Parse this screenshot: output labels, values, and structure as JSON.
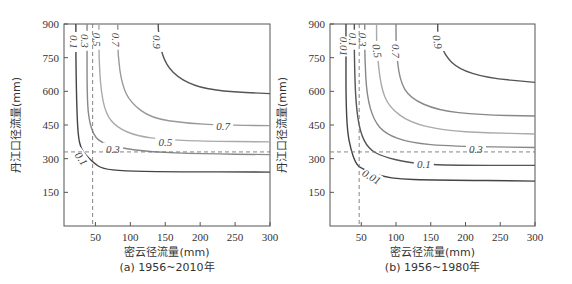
{
  "chart_data": [
    {
      "type": "contour",
      "panel": "a",
      "caption": "(a) 1956~2010年",
      "xlabel": "密云径流量(mm)",
      "ylabel": "丹江口径流量(mm)",
      "xticks": [
        50,
        100,
        150,
        200,
        250,
        300
      ],
      "yticks": [
        150,
        300,
        450,
        600,
        750,
        900
      ],
      "xlim": [
        5,
        300
      ],
      "ylim": [
        0,
        900
      ],
      "reference_lines": {
        "x": 46,
        "y": 330,
        "style": "dashed"
      },
      "contours": [
        {
          "level": "0.1",
          "color": "#444444",
          "points": [
            [
              22,
              900
            ],
            [
              22,
              760
            ],
            [
              23,
              560
            ],
            [
              25,
              400
            ],
            [
              30,
              340
            ],
            [
              38,
              310
            ],
            [
              48,
              280
            ],
            [
              60,
              255
            ],
            [
              90,
              245
            ],
            [
              150,
              242
            ],
            [
              300,
              240
            ]
          ],
          "label": {
            "x": 20,
            "y": 820,
            "rot": 90
          },
          "label2": {
            "x": 30,
            "y": 300,
            "rot": 55
          }
        },
        {
          "level": "0.3",
          "color": "#888888",
          "points": [
            [
              38,
              900
            ],
            [
              38,
              800
            ],
            [
              38,
              600
            ],
            [
              40,
              480
            ],
            [
              48,
              400
            ],
            [
              60,
              370
            ],
            [
              80,
              350
            ],
            [
              130,
              330
            ],
            [
              200,
              322
            ],
            [
              300,
              318
            ]
          ],
          "label": {
            "x": 35,
            "y": 825,
            "rot": 90
          },
          "label2": {
            "x": 75,
            "y": 345,
            "rot": 0
          }
        },
        {
          "level": "0.5",
          "color": "#aaaaaa",
          "points": [
            [
              55,
              900
            ],
            [
              55,
              750
            ],
            [
              58,
              600
            ],
            [
              65,
              500
            ],
            [
              80,
              440
            ],
            [
              110,
              400
            ],
            [
              150,
              385
            ],
            [
              200,
              378
            ],
            [
              300,
              375
            ]
          ],
          "label": {
            "x": 52,
            "y": 830,
            "rot": 90
          },
          "label2": {
            "x": 150,
            "y": 375,
            "rot": 0
          }
        },
        {
          "level": "0.7",
          "color": "#999999",
          "points": [
            [
              82,
              900
            ],
            [
              82,
              760
            ],
            [
              88,
              630
            ],
            [
              100,
              550
            ],
            [
              130,
              480
            ],
            [
              180,
              458
            ],
            [
              230,
              450
            ],
            [
              300,
              447
            ]
          ],
          "label": {
            "x": 80,
            "y": 830,
            "rot": 90
          },
          "label2": {
            "x": 233,
            "y": 445,
            "rot": 0
          }
        },
        {
          "level": "0.9",
          "color": "#555555",
          "points": [
            [
              140,
              900
            ],
            [
              140,
              870
            ],
            [
              145,
              760
            ],
            [
              160,
              680
            ],
            [
              190,
              625
            ],
            [
              230,
              600
            ],
            [
              300,
              590
            ]
          ],
          "label": {
            "x": 138,
            "y": 820,
            "rot": 90
          }
        }
      ]
    },
    {
      "type": "contour",
      "panel": "b",
      "caption": "(b) 1956~1980年",
      "xlabel": "密云径流量(mm)",
      "ylabel": "丹江口径流量(mm)",
      "xticks": [
        50,
        100,
        150,
        200,
        250,
        300
      ],
      "yticks": [
        150,
        300,
        450,
        600,
        750,
        900
      ],
      "xlim": [
        5,
        300
      ],
      "ylim": [
        0,
        900
      ],
      "reference_lines": {
        "x": 47,
        "y": 330,
        "style": "dashed"
      },
      "contours": [
        {
          "level": "0.01",
          "color": "#444444",
          "points": [
            [
              28,
              900
            ],
            [
              28,
              740
            ],
            [
              28,
              560
            ],
            [
              30,
              420
            ],
            [
              35,
              340
            ],
            [
              42,
              280
            ],
            [
              50,
              255
            ],
            [
              90,
              210
            ],
            [
              160,
              205
            ],
            [
              300,
              200
            ]
          ],
          "label": {
            "x": 25,
            "y": 800,
            "rot": 90
          },
          "label2": {
            "x": 65,
            "y": 220,
            "rot": 30
          }
        },
        {
          "level": "0.1",
          "color": "#555555",
          "points": [
            [
              40,
              900
            ],
            [
              40,
              750
            ],
            [
              42,
              550
            ],
            [
              48,
              420
            ],
            [
              60,
              345
            ],
            [
              80,
              310
            ],
            [
              120,
              280
            ],
            [
              170,
              270
            ],
            [
              300,
              270
            ]
          ],
          "label": {
            "x": 38,
            "y": 830,
            "rot": 90
          },
          "label2": {
            "x": 140,
            "y": 275,
            "rot": 0
          }
        },
        {
          "level": "0.3",
          "color": "#888888",
          "points": [
            [
              55,
              900
            ],
            [
              55,
              750
            ],
            [
              58,
              580
            ],
            [
              68,
              470
            ],
            [
              85,
              410
            ],
            [
              120,
              370
            ],
            [
              180,
              355
            ],
            [
              300,
              350
            ]
          ],
          "label": {
            "x": 52,
            "y": 830,
            "rot": 90
          },
          "label2": {
            "x": 215,
            "y": 345,
            "rot": 0
          }
        },
        {
          "level": "0.5",
          "color": "#aaaaaa",
          "points": [
            [
              72,
              900
            ],
            [
              72,
              800
            ],
            [
              78,
              620
            ],
            [
              90,
              530
            ],
            [
              120,
              460
            ],
            [
              170,
              425
            ],
            [
              230,
              415
            ],
            [
              300,
              410
            ]
          ],
          "label": {
            "x": 73,
            "y": 780,
            "rot": 80
          }
        },
        {
          "level": "0.7",
          "color": "#888888",
          "points": [
            [
              100,
              900
            ],
            [
              100,
              800
            ],
            [
              105,
              650
            ],
            [
              120,
              570
            ],
            [
              160,
              515
            ],
            [
              220,
              495
            ],
            [
              300,
              490
            ]
          ],
          "label": {
            "x": 100,
            "y": 780,
            "rot": 90
          }
        },
        {
          "level": "0.9",
          "color": "#555555",
          "points": [
            [
              160,
              900
            ],
            [
              160,
              850
            ],
            [
              170,
              760
            ],
            [
              190,
              700
            ],
            [
              230,
              660
            ],
            [
              300,
              640
            ]
          ],
          "label": {
            "x": 160,
            "y": 820,
            "rot": 80
          }
        }
      ]
    }
  ],
  "panels": [
    {
      "caption": "(a) 1956~2010年",
      "xlabel": "密云径流量(mm)",
      "ylabel": "丹江口径流量(mm)"
    },
    {
      "caption": "(b) 1956~1980年",
      "xlabel": "密云径流量(mm)",
      "ylabel": "丹江口径流量(mm)"
    }
  ]
}
